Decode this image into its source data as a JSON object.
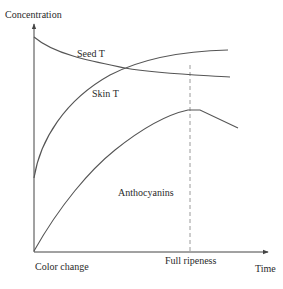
{
  "diagram": {
    "y_axis_label": "Concentration",
    "x_axis_label": "Time",
    "x_markers": {
      "start": "Color change",
      "full_ripeness": "Full ripeness"
    },
    "curves": [
      {
        "name": "Seed T",
        "trend": "decreasing from high at color change, leveling off"
      },
      {
        "name": "Skin T",
        "trend": "increasing rapidly after color change, leveling off"
      },
      {
        "name": "Anthocyanins",
        "trend": "increasing from zero, peaking at full ripeness, then declining"
      }
    ],
    "colors": {
      "curve": "#555555",
      "axis": "#444444",
      "dashed_marker": "#9a9a9a",
      "text": "#2a2a2a"
    }
  }
}
